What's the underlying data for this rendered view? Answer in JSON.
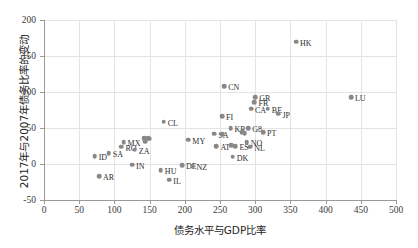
{
  "chart_data": {
    "type": "scatter",
    "title": "",
    "xlabel": "债务水平与GDP比率",
    "ylabel": "2017年与2007年债务比率的变动",
    "xlim": [
      0,
      500
    ],
    "ylim": [
      -50,
      200
    ],
    "xticks": [
      0,
      50,
      100,
      150,
      200,
      250,
      300,
      350,
      400,
      450,
      500
    ],
    "yticks": [
      -50,
      0,
      50,
      100,
      150,
      200
    ],
    "grid": true,
    "legend": "none",
    "marker_color": "#888888",
    "points": [
      {
        "label": "HK",
        "x": 358,
        "y": 170
      },
      {
        "label": "LU",
        "x": 436,
        "y": 93
      },
      {
        "label": "CN",
        "x": 256,
        "y": 108
      },
      {
        "label": "GR",
        "x": 300,
        "y": 93
      },
      {
        "label": "FR",
        "x": 299,
        "y": 86
      },
      {
        "label": "CA",
        "x": 294,
        "y": 77
      },
      {
        "label": "BE",
        "x": 318,
        "y": 77
      },
      {
        "label": "JP",
        "x": 333,
        "y": 70
      },
      {
        "label": "CL",
        "x": 170,
        "y": 59
      },
      {
        "label": "FI",
        "x": 253,
        "y": 66
      },
      {
        "label": "KR",
        "x": 265,
        "y": 50
      },
      {
        "label": "G8",
        "x": 290,
        "y": 50
      },
      {
        "label": "PT",
        "x": 311,
        "y": 44
      },
      {
        "label": "SE",
        "x": 281,
        "y": 44
      },
      {
        "label": "CH",
        "x": 285,
        "y": 43
      },
      {
        "label": "SA",
        "x": 242,
        "y": 42
      },
      {
        "label": "AU",
        "x": 253,
        "y": 41
      },
      {
        "label": "NO",
        "x": 288,
        "y": 30
      },
      {
        "label": "NL",
        "x": 293,
        "y": 24
      },
      {
        "label": "ES",
        "x": 272,
        "y": 25
      },
      {
        "label": "AT",
        "x": 245,
        "y": 25
      },
      {
        "label": "US",
        "x": 266,
        "y": 26
      },
      {
        "label": "DK",
        "x": 268,
        "y": 10
      },
      {
        "label": "MY",
        "x": 205,
        "y": 34
      },
      {
        "label": "TR",
        "x": 148,
        "y": 36
      },
      {
        "label": "PL",
        "x": 150,
        "y": 35
      },
      {
        "label": "CZ",
        "x": 144,
        "y": 32
      },
      {
        "label": "CO",
        "x": 142,
        "y": 36
      },
      {
        "label": "MX",
        "x": 113,
        "y": 30
      },
      {
        "label": "RO",
        "x": 110,
        "y": 24
      },
      {
        "label": "SA2",
        "x": 92,
        "y": 15
      },
      {
        "label": "ID",
        "x": 72,
        "y": 11
      },
      {
        "label": "ZA",
        "x": 129,
        "y": 20
      },
      {
        "label": "IN",
        "x": 125,
        "y": -1
      },
      {
        "label": "HU",
        "x": 166,
        "y": -9
      },
      {
        "label": "DE",
        "x": 196,
        "y": -2
      },
      {
        "label": "NZ",
        "x": 211,
        "y": -3
      },
      {
        "label": "IL",
        "x": 178,
        "y": -22
      },
      {
        "label": "AR",
        "x": 78,
        "y": -17
      }
    ],
    "labels_visible": [
      "HK",
      "LU",
      "CN",
      "GR",
      "FR",
      "CA",
      "BE",
      "JP",
      "CL",
      "FI",
      "KR",
      "G8",
      "PT",
      "MY",
      "ZA",
      "IN",
      "HU",
      "DE",
      "NZ",
      "IL",
      "AR",
      "MX",
      "RO",
      "SA",
      "ID",
      "NO",
      "NL",
      "DK",
      "AT",
      "ES"
    ]
  }
}
